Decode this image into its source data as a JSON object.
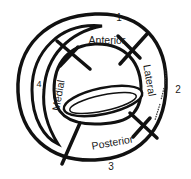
{
  "diagram": {
    "regions": {
      "anterior": "Anterior",
      "posterior": "Posterior",
      "medial": "Medial",
      "lateral": "Lateral"
    },
    "zone_numbers": [
      "1",
      "2",
      "3",
      "4"
    ],
    "colors": {
      "ink": "#111111",
      "background": "#ffffff"
    }
  }
}
